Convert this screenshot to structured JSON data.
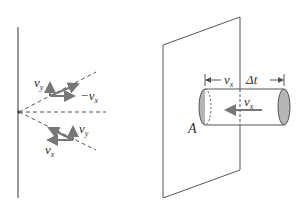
{
  "left_panel": {
    "labels": {
      "vy_top": "v",
      "vy_top_sub": "y",
      "neg_vx": "−v",
      "neg_vx_sub": "x",
      "vy_bottom": "v",
      "vy_bottom_sub": "y",
      "vx_bottom": "v",
      "vx_bottom_sub": "x"
    }
  },
  "right_panel": {
    "labels": {
      "dim_vx": "v",
      "dim_vx_sub": "x",
      "dim_dt": "Δt",
      "flow_vx": "v",
      "flow_vx_sub": "x",
      "area": "A"
    }
  },
  "colors": {
    "line": "#555555",
    "arrow": "#777777",
    "cap_fill": "#b5b5b5"
  }
}
